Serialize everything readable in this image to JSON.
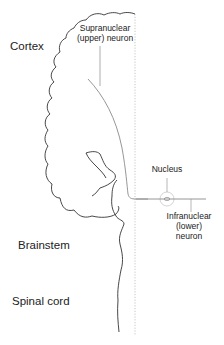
{
  "diagram": {
    "type": "neuroanatomy-schematic",
    "regions": [
      {
        "id": "cortex",
        "label": "Cortex"
      },
      {
        "id": "brainstem",
        "label": "Brainstem"
      },
      {
        "id": "spinal_cord",
        "label": "Spinal cord"
      }
    ],
    "annotations": {
      "upper_neuron": {
        "line1": "Supranuclear",
        "line2": "(upper) neuron"
      },
      "nucleus": {
        "label": "Nucleus"
      },
      "lower_neuron": {
        "line1": "Infranuclear",
        "line2": "(lower)",
        "line3": "neuron"
      }
    },
    "colors": {
      "outline": "#333333",
      "neuron_path": "#888888",
      "midline": "#b0b0b0",
      "text": "#222222"
    }
  }
}
